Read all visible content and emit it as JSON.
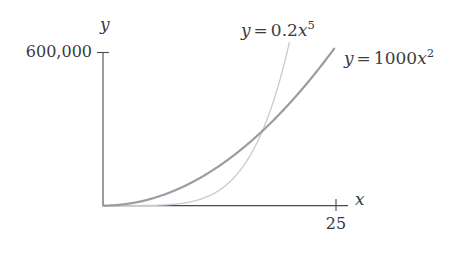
{
  "chart_data": {
    "type": "line",
    "title": "",
    "xlabel": "x",
    "ylabel": "y",
    "grid": false,
    "legend_position": "inline-near-curves",
    "xlim": [
      0,
      26.3
    ],
    "ylim": [
      0,
      640000
    ],
    "x_ticks": [
      {
        "value": 25,
        "label": "25"
      }
    ],
    "y_ticks": [
      {
        "value": 600000,
        "label": "600,000"
      }
    ],
    "series": [
      {
        "name": "quadratic",
        "label": "y = 1000x^2",
        "label_parts": {
          "lhs": "y",
          "op": "=",
          "coefficient": "1000",
          "variable": "x",
          "exponent": "2"
        },
        "color": "#9b9ba3",
        "width": 2.2,
        "formula": "y = 1000*x^2",
        "x": [
          0,
          2,
          4,
          6,
          8,
          10,
          12,
          14,
          16,
          18,
          20,
          22,
          24,
          24.8
        ],
        "values": [
          0,
          4000,
          16000,
          36000,
          64000,
          100000,
          144000,
          196000,
          256000,
          324000,
          400000,
          484000,
          576000,
          615040
        ]
      },
      {
        "name": "quintic",
        "label": "y = 0.2x^5",
        "label_parts": {
          "lhs": "y",
          "op": "=",
          "coefficient": "0.2",
          "variable": "x",
          "exponent": "5"
        },
        "color": "#c9c9d0",
        "width": 1.3,
        "formula": "y = 0.2*x^5",
        "x": [
          0,
          2,
          4,
          6,
          8,
          10,
          12,
          14,
          16,
          18,
          19,
          20,
          20.2
        ],
        "values": [
          0,
          6.4,
          204.8,
          1555.2,
          6553.6,
          20000,
          49766.4,
          107564.8,
          209715.2,
          377913.6,
          495219.8,
          640000,
          672605
        ]
      }
    ],
    "intersection": {
      "x": 17.1,
      "y": 292410
    },
    "axis_color": "#4a4a50",
    "tick_color": "#4a4a50",
    "text_color": "#3b3b40",
    "background": "#ffffff"
  },
  "labels": {
    "axis_y": "y",
    "axis_x": "x",
    "y_tick": "600,000",
    "x_tick": "25"
  }
}
